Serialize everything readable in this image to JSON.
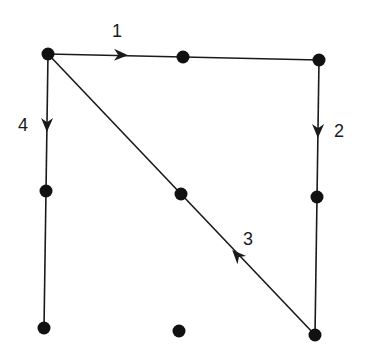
{
  "diagram": {
    "colors": {
      "ink": "#1a1a1a",
      "background": "#ffffff"
    },
    "dots": [
      {
        "id": "r1c1",
        "x": 48,
        "y": 54
      },
      {
        "id": "r1c2",
        "x": 183,
        "y": 57
      },
      {
        "id": "r1c3",
        "x": 319,
        "y": 60
      },
      {
        "id": "r2c1",
        "x": 46,
        "y": 191
      },
      {
        "id": "r2c2",
        "x": 181,
        "y": 194
      },
      {
        "id": "r2c3",
        "x": 317,
        "y": 197
      },
      {
        "id": "r3c1",
        "x": 44,
        "y": 328
      },
      {
        "id": "r3c2",
        "x": 179,
        "y": 331
      },
      {
        "id": "r3c3",
        "x": 315,
        "y": 335
      }
    ],
    "segments": [
      {
        "label": "1",
        "from": "r1c1",
        "to": "r1c3",
        "arrow_at": [
          121,
          55
        ],
        "direction": "right"
      },
      {
        "label": "2",
        "from": "r1c3",
        "to": "r3c3",
        "arrow_at": [
          318,
          131
        ],
        "direction": "down"
      },
      {
        "label": "3",
        "from": "r3c3",
        "to": "r1c1",
        "arrow_at": [
          237,
          255
        ],
        "direction": "up-left"
      },
      {
        "label": "4",
        "from": "r1c1",
        "to": "r3c1",
        "arrow_at": [
          47,
          125
        ],
        "direction": "down"
      }
    ],
    "labels": [
      {
        "text": "1",
        "x": 112,
        "y": 22
      },
      {
        "text": "2",
        "x": 334,
        "y": 122
      },
      {
        "text": "3",
        "x": 243,
        "y": 230
      },
      {
        "text": "4",
        "x": 18,
        "y": 116
      }
    ]
  }
}
